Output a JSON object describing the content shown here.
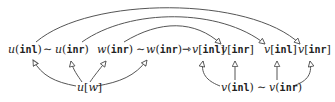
{
  "diagram": {
    "top_row": [
      {
        "id": "u_inl",
        "fn": "u",
        "arg": "inl",
        "bracket": "()"
      },
      {
        "id": "sim1",
        "symbol": "∼"
      },
      {
        "id": "u_inr",
        "fn": "u",
        "arg": "inr",
        "bracket": "()"
      },
      {
        "id": "w_inr_1",
        "fn": "w",
        "arg": "inr",
        "bracket": "()"
      },
      {
        "id": "sim2",
        "symbol": "∼"
      },
      {
        "id": "w_inr_2",
        "fn": "w",
        "arg": "inr",
        "bracket": "()"
      },
      {
        "id": "maps_to",
        "symbol": "⇾"
      },
      {
        "id": "v_inl_1",
        "fn": "v",
        "arg": "inl",
        "bracket": "[]"
      },
      {
        "id": "v_inr_1",
        "fn": "v",
        "arg": "inr",
        "bracket": "[]"
      },
      {
        "id": "v_inl_2",
        "fn": "v",
        "arg": "inl",
        "bracket": "[]"
      },
      {
        "id": "v_inr_2",
        "fn": "v",
        "arg": "inr",
        "bracket": "[]"
      }
    ],
    "bottom_nodes": [
      {
        "id": "u_w",
        "text": "u[w]",
        "fn": "u",
        "arg": "w"
      },
      {
        "id": "v_pair",
        "text": "v(inl) ∼ v(inr)"
      }
    ],
    "edges": [
      {
        "from": "u_w",
        "to": "u_inl"
      },
      {
        "from": "u_w",
        "to": "u_inr"
      },
      {
        "from": "u_w",
        "to": "w_inr_1"
      },
      {
        "from": "u_w",
        "to": "w_inr_2"
      },
      {
        "from": "v_pair",
        "to": "v_inl_1"
      },
      {
        "from": "v_pair",
        "to": "v_inr_1"
      },
      {
        "from": "v_pair",
        "to": "v_inl_2"
      },
      {
        "from": "v_pair",
        "to": "v_inr_2"
      },
      {
        "from": "w_inr_1",
        "to": "v_inr_1",
        "style": "arc"
      },
      {
        "from": "u_inr",
        "to": "v_inl_2",
        "style": "arc"
      },
      {
        "from": "u_inl",
        "to": "v_inr_2",
        "style": "arc"
      }
    ],
    "labels": {
      "u": "u",
      "w": "w",
      "v": "v",
      "inl": "inl",
      "inr": "inr",
      "sim": "∼",
      "arrow": "⇾",
      "lp": "(",
      "rp": ")",
      "lb": "[",
      "rb": "]"
    }
  }
}
